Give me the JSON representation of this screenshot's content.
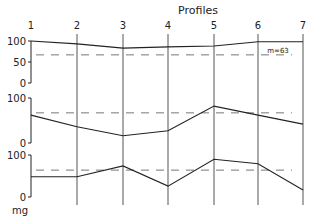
{
  "chart_data": {
    "type": "line",
    "title": "Profiles",
    "xlabel": "",
    "ylabel": "mg",
    "categories": [
      "1",
      "2",
      "3",
      "4",
      "5",
      "6",
      "7"
    ],
    "panels": [
      {
        "name": "panel-1",
        "ylim": [
          0,
          100
        ],
        "yticks": [
          "100",
          "50",
          "0"
        ],
        "values": [
          100,
          93,
          83,
          86,
          88,
          98,
          98
        ],
        "reference_line": 67,
        "annotation": "m=63"
      },
      {
        "name": "panel-2",
        "ylim": [
          0,
          100
        ],
        "yticks": [
          "100",
          "0"
        ],
        "values": [
          62,
          36,
          16,
          27,
          82,
          62,
          42
        ],
        "reference_line": 67
      },
      {
        "name": "panel-3",
        "ylim": [
          0,
          100
        ],
        "yticks": [
          "100",
          "0"
        ],
        "values": [
          48,
          48,
          74,
          26,
          90,
          79,
          17
        ],
        "reference_line": 64
      }
    ],
    "grid": false,
    "legend": null
  },
  "labels": {
    "title": "Profiles",
    "unit": "mg",
    "annotation": "m=63"
  },
  "colors": {
    "line": "#222222",
    "grid": "#555555",
    "dash": "#777777"
  }
}
